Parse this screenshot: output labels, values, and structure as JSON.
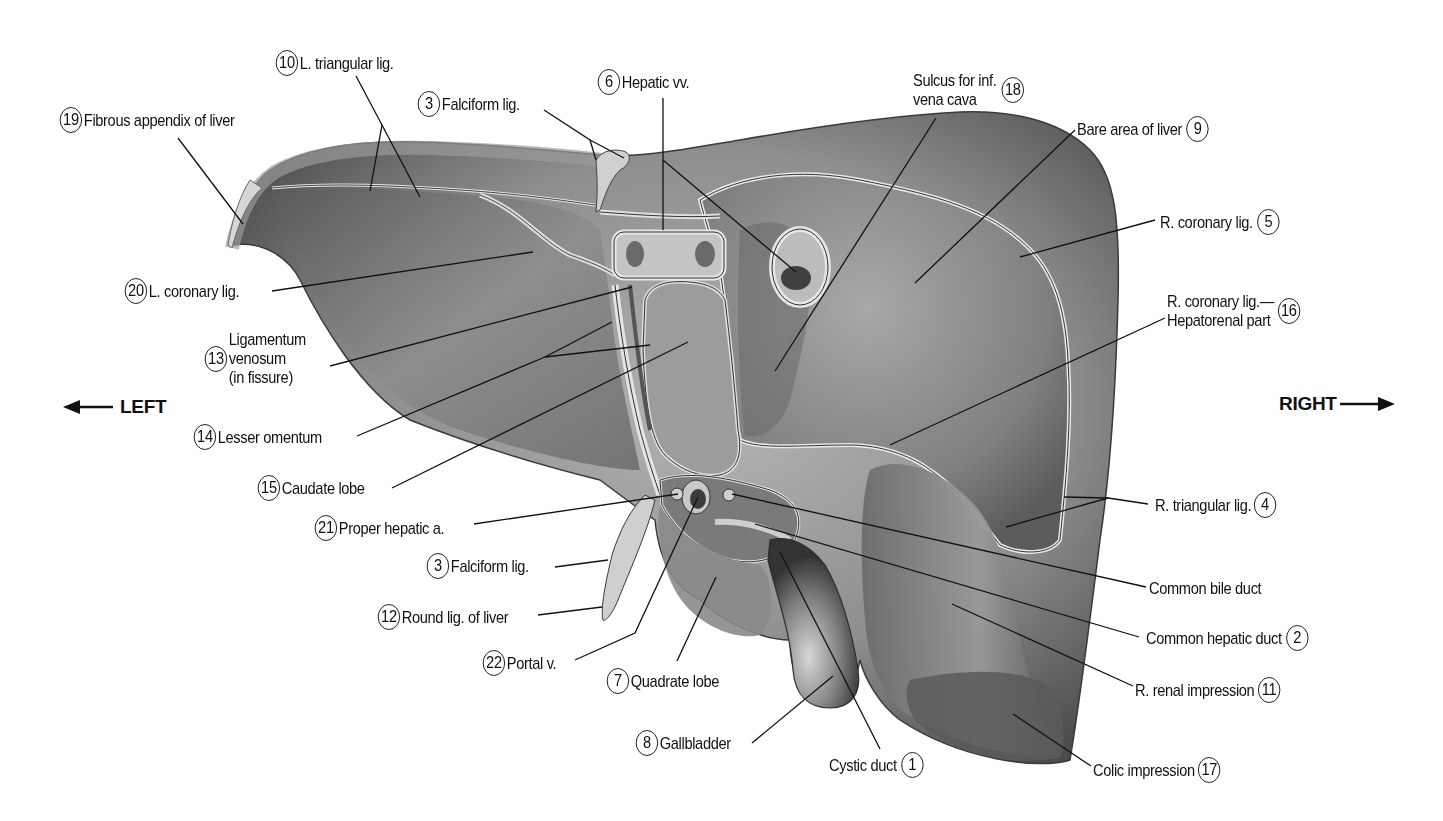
{
  "figure": {
    "orientation": {
      "left_label": "LEFT",
      "right_label": "RIGHT"
    }
  },
  "labels": [
    {
      "id": "l19",
      "num": "19",
      "text": "Fibrous appendix of liver"
    },
    {
      "id": "l10",
      "num": "10",
      "text": "L. triangular lig."
    },
    {
      "id": "l3a",
      "num": "3",
      "text": "Falciform lig."
    },
    {
      "id": "l6",
      "num": "6",
      "text": "Hepatic vv."
    },
    {
      "id": "l18",
      "num": "18",
      "lines": [
        "Sulcus for inf.",
        "vena cava"
      ]
    },
    {
      "id": "l9",
      "num": "9",
      "text": "Bare area of liver"
    },
    {
      "id": "l5",
      "num": "5",
      "text": "R. coronary lig."
    },
    {
      "id": "l16",
      "num": "16",
      "lines": [
        "R. coronary lig.—",
        "Hepatorenal part"
      ]
    },
    {
      "id": "l20",
      "num": "20",
      "text": "L. coronary lig."
    },
    {
      "id": "l13",
      "num": "13",
      "lines": [
        "Ligamentum",
        "venosum",
        "(in fissure)"
      ]
    },
    {
      "id": "l14",
      "num": "14",
      "text": "Lesser omentum"
    },
    {
      "id": "l15",
      "num": "15",
      "text": "Caudate lobe"
    },
    {
      "id": "l21",
      "num": "21",
      "text": "Proper hepatic a."
    },
    {
      "id": "l3b",
      "num": "3",
      "text": "Falciform lig."
    },
    {
      "id": "l12",
      "num": "12",
      "text": "Round lig. of liver"
    },
    {
      "id": "l22",
      "num": "22",
      "text": "Portal v."
    },
    {
      "id": "l7",
      "num": "7",
      "text": "Quadrate lobe"
    },
    {
      "id": "l8",
      "num": "8",
      "text": "Gallbladder"
    },
    {
      "id": "l1",
      "num": "1",
      "text": "Cystic duct"
    },
    {
      "id": "l4",
      "num": "4",
      "text": "R. triangular lig."
    },
    {
      "id": "lcbd",
      "num": "",
      "text": "Common bile duct"
    },
    {
      "id": "l2",
      "num": "2",
      "text": "Common hepatic duct"
    },
    {
      "id": "l11",
      "num": "11",
      "text": "R. renal impression"
    },
    {
      "id": "l17",
      "num": "17",
      "text": "Colic impression"
    }
  ],
  "colors": {
    "ink": "#111111",
    "liver_light": "#b8b8b8",
    "liver_mid": "#8a8a8a",
    "liver_dark": "#4a4a4a",
    "background": "#ffffff"
  }
}
